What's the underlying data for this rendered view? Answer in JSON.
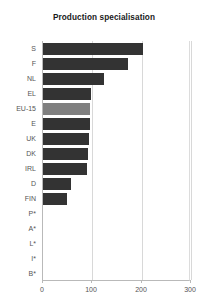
{
  "chart_data": {
    "type": "bar",
    "orientation": "horizontal",
    "title": "Production specialisation",
    "xlabel": "",
    "ylabel": "",
    "categories": [
      "S",
      "F",
      "NL",
      "EL",
      "EU-15",
      "E",
      "UK",
      "DK",
      "IRL",
      "D",
      "FIN",
      "P*",
      "A*",
      "L*",
      "I*",
      "B*"
    ],
    "values": [
      203,
      173,
      124,
      98,
      95,
      95,
      93,
      92,
      90,
      57,
      49,
      0,
      0,
      0,
      0,
      0
    ],
    "xlim": [
      0,
      300
    ],
    "xticks": [
      0,
      100,
      200,
      300
    ],
    "xtick_labels": [
      "0",
      "100",
      "200",
      "300"
    ],
    "grid": true,
    "gridlines_at": [
      100,
      200,
      300
    ],
    "legend": null,
    "highlight_category": "EU-15",
    "bar_color": "#333333",
    "highlight_color": "#7f7f7f",
    "grid_color": "#d8d8d8",
    "axis_color": "#b9b9b9",
    "text_color": "#555555",
    "title_color": "#1a1a1a"
  }
}
